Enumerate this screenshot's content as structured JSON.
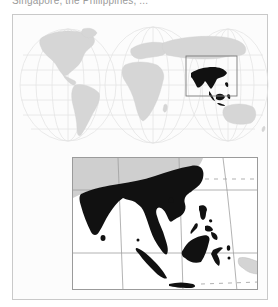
{
  "caption": {
    "text": "Singapore, the Philippines, ..."
  },
  "figure": {
    "type": "locator-map",
    "world_map": {
      "projection": "interrupted hemispheres (three lobes)",
      "land_color": "#d6d6d6",
      "graticule_color": "#e2e2e2",
      "highlight_box": {
        "color": "#7a7a7a"
      },
      "highlight_region_color": "#111111"
    },
    "inset_map": {
      "region": "South and Southeast Asia",
      "highlight_color": "#111111",
      "other_land_color": "#cfcfcf",
      "graticule_color": "#9a9a9a",
      "dashed_line_color": "#a8a8a8"
    }
  }
}
